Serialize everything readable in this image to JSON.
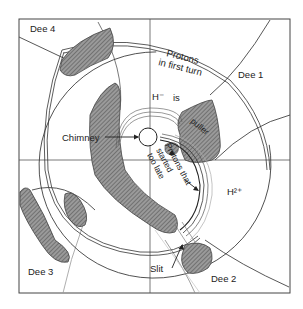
{
  "diagram": {
    "labels": {
      "dee1": "Dee 1",
      "dee2": "Dee 2",
      "dee3": "Dee 3",
      "dee4": "Dee 4",
      "protons_first_turn_line1": "Protons",
      "protons_first_turn_line2": "in first turn",
      "h_minus": "H⁻",
      "is": "is",
      "puller": "puller",
      "chimney": "Chimney",
      "protons_late_line1": "Protons that",
      "protons_late_line2": "started",
      "protons_late_line3": "too late",
      "h2_plus": "H²⁺",
      "slit": "Slit"
    },
    "colors": {
      "stroke": "#333333",
      "hatch_fill": "#8a8a8a",
      "background": "#ffffff"
    }
  }
}
